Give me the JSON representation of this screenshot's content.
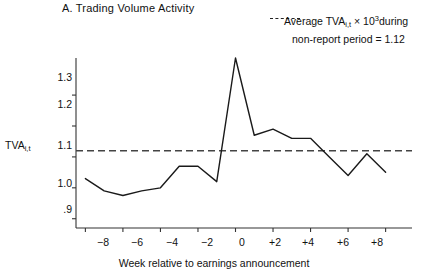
{
  "panel": {
    "label": "A.",
    "title": "A. Trading Volume Activity"
  },
  "legend": {
    "line1_pre": "Average TVA",
    "line1_sub": "i,t",
    "line1_mid": " × 10",
    "line1_sup": "3",
    "line1_post": "during",
    "line2": "non-report period = 1.12",
    "dash_style": "dashed",
    "reference_value": 1.12
  },
  "axes": {
    "ylabel_main": "TVA",
    "ylabel_sub": "i,t",
    "xlabel": "Week relative to earnings announcement",
    "ytick_labels": [
      "1.3",
      "1.2",
      "1.1",
      "1.0",
      ".9"
    ],
    "xtick_labels": [
      "−8",
      "−6",
      "−4",
      "−2",
      "0",
      "+2",
      "+4",
      "+6",
      "+8"
    ]
  },
  "colors": {
    "line": "#1a1a1a",
    "reference_line": "#444444",
    "axis": "#333333",
    "background": "#ffffff",
    "text": "#111111"
  },
  "chart_data": {
    "type": "line",
    "title": "A. Trading Volume Activity",
    "xlabel": "Week relative to earnings announcement",
    "ylabel": "TVA(i,t)",
    "xlim": [
      -8.5,
      8.5
    ],
    "ylim": [
      0.87,
      1.42
    ],
    "grid": false,
    "legend_position": "top-right",
    "xtick_values": [
      -8,
      -6,
      -4,
      -2,
      0,
      2,
      4,
      6,
      8
    ],
    "ytick_values": [
      1.3,
      1.2,
      1.1,
      1.0,
      0.9
    ],
    "series": [
      {
        "name": "Average TVA(i,t) x 10^3",
        "x": [
          -8,
          -7,
          -6,
          -5,
          -4,
          -3,
          -2,
          -1,
          0,
          1,
          2,
          3,
          4,
          5,
          6,
          7,
          8
        ],
        "values": [
          1.03,
          0.99,
          0.975,
          0.99,
          1.0,
          1.07,
          1.07,
          1.02,
          1.42,
          1.17,
          1.19,
          1.16,
          1.16,
          1.1,
          1.04,
          1.11,
          1.05
        ]
      }
    ],
    "reference_line": {
      "label": "Average TVA(i,t) x 10^3 during non-report period",
      "value": 1.12,
      "style": "dashed"
    },
    "annotations": [
      {
        "text": "peak at week 0 extends above plot frame",
        "x": 0,
        "y": 1.42
      }
    ]
  }
}
